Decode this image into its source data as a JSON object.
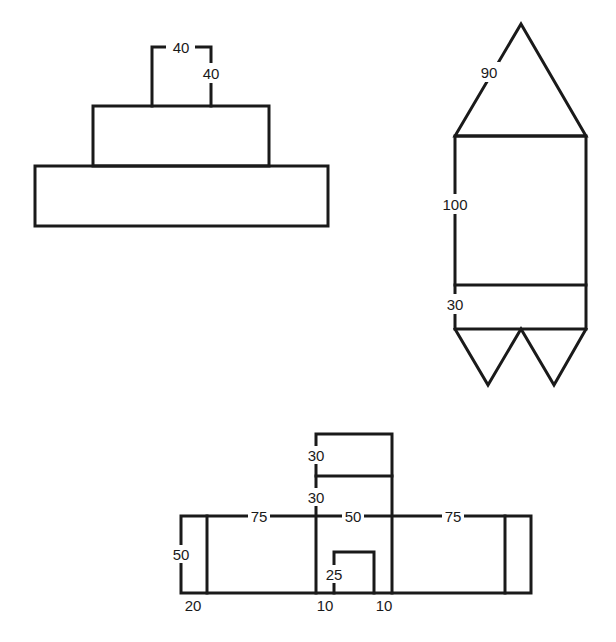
{
  "diagram": {
    "stroke_color": "#1a1a1a",
    "background": "#ffffff",
    "figures": [
      {
        "id": "stacked-rectangles",
        "description": "A square on top of a rectangle on top of a wider rectangle",
        "labels": {
          "square_top_width": "40",
          "square_right_height": "40"
        }
      },
      {
        "id": "rocket",
        "description": "Triangle on top of a rectangle with a band, two triangles below",
        "labels": {
          "triangle_side": "90",
          "rect_height": "100",
          "band_height": "30"
        }
      },
      {
        "id": "house-with-tower",
        "description": "Long rectangle with a central tower and door, end bands on both sides",
        "labels": {
          "tower_top_height": "30",
          "tower_mid_height": "30",
          "left_width": "75",
          "center_width": "50",
          "right_width": "75",
          "left_height": "50",
          "left_band_width": "20",
          "door_height": "25",
          "door_left_offset": "10",
          "door_right_offset": "10"
        }
      }
    ]
  }
}
